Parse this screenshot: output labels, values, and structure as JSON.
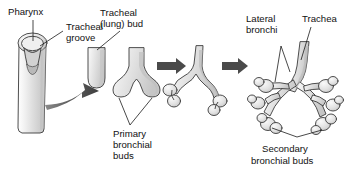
{
  "figure": {
    "background_color": "#ffffff",
    "width": 347,
    "height": 171
  },
  "labels": {
    "pharynx": "Pharynx",
    "tracheal_groove_line1": "Tracheal",
    "tracheal_groove_line2": "groove",
    "tracheal_bud_line1": "Tracheal",
    "tracheal_bud_line2": "(lung) bud",
    "primary_buds_line1": "Primary",
    "primary_buds_line2": "bronchial",
    "primary_buds_line3": "buds",
    "lateral_bronchi_line1": "Lateral",
    "lateral_bronchi_line2": "bronchi",
    "trachea": "Trachea",
    "secondary_buds_line1": "Secondary",
    "secondary_buds_line2": "bronchial buds"
  },
  "stages": [
    {
      "id": "stage-1",
      "name": "pharynx-tracheal-groove",
      "caption": "Pharynx with tracheal groove"
    },
    {
      "id": "stage-2",
      "name": "tracheal-lung-bud",
      "caption": "Tracheal (lung) bud"
    },
    {
      "id": "stage-3",
      "name": "primary-bronchial-buds",
      "caption": "Primary bronchial buds"
    },
    {
      "id": "stage-4",
      "name": "lateral-bronchi-stage",
      "caption": "Lateral bronchi forming"
    },
    {
      "id": "stage-5",
      "name": "secondary-bronchial-buds",
      "caption": "Secondary bronchial buds"
    }
  ],
  "arrows": [
    {
      "name": "curved-progression-arrow",
      "style": "curved-thick"
    },
    {
      "name": "progression-arrow-1",
      "style": "straight-block"
    },
    {
      "name": "progression-arrow-2",
      "style": "straight-block"
    },
    {
      "name": "progression-arrow-3",
      "style": "straight-block"
    }
  ],
  "colors": {
    "tissue_fill_light": "#e8e8e8",
    "tissue_fill_mid": "#d6d6d6",
    "tissue_fill_dark": "#bdbdbd",
    "outline": "#3a3a3a",
    "text": "#111111",
    "arrow": "#4a4a4a",
    "background": "#ffffff"
  }
}
